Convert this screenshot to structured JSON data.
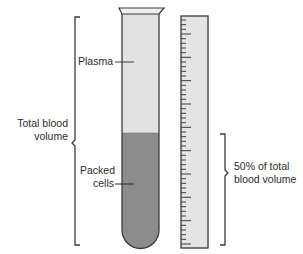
{
  "diagram": {
    "labels": {
      "plasma": "Plasma",
      "packed_cells_line1": "Packed",
      "packed_cells_line2": "cells",
      "total_blood_line1": "Total blood",
      "total_blood_line2": "volume",
      "fifty_percent_line1": "50% of total",
      "fifty_percent_line2": "blood volume"
    },
    "components": {
      "test_tube": "test-tube",
      "plasma_layer": "plasma",
      "packed_cells_layer": "packed-cells",
      "graduated_scale": "ruler",
      "total_volume_bracket": "bracket-total",
      "hematocrit_bracket": "bracket-50-percent"
    },
    "colors": {
      "plasma": "#e2e2e2",
      "packed_cells": "#8c8c8c",
      "ruler_fill": "#e4e4e4",
      "outline": "#3a3a3a"
    }
  }
}
